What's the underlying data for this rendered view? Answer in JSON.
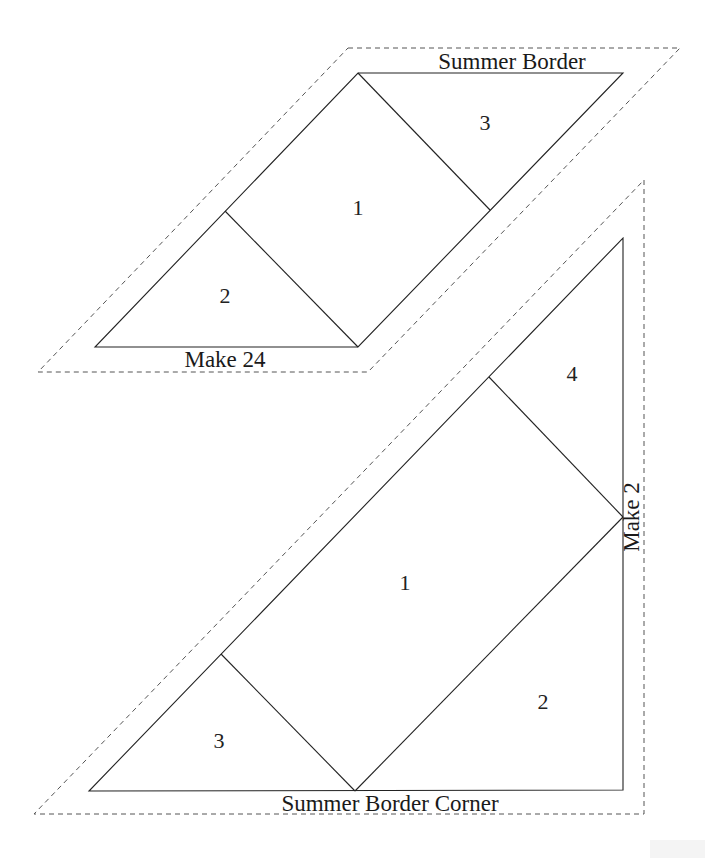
{
  "diagram": {
    "type": "foundation paper piecing templates",
    "colors": {
      "lines": "#222222",
      "cut_line": "#555555",
      "background": "#ffffff"
    },
    "templates": [
      {
        "name": "Summer Border",
        "title": "Summer Border",
        "quantity_label": "Make 24",
        "pieces": [
          {
            "number": "1",
            "shape": "square"
          },
          {
            "number": "2",
            "shape": "triangle"
          },
          {
            "number": "3",
            "shape": "triangle"
          }
        ]
      },
      {
        "name": "Summer Border Corner",
        "title": "Summer Border Corner",
        "quantity_label": "Make 2",
        "pieces": [
          {
            "number": "1",
            "shape": "rectangle"
          },
          {
            "number": "2",
            "shape": "triangle"
          },
          {
            "number": "3",
            "shape": "triangle"
          },
          {
            "number": "4",
            "shape": "triangle"
          }
        ]
      }
    ]
  }
}
